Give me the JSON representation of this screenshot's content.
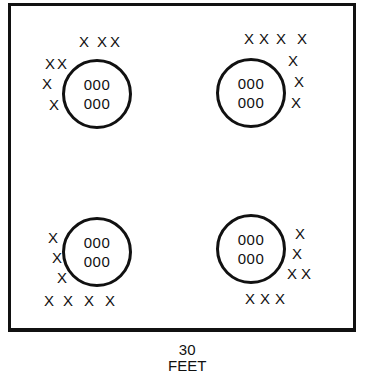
{
  "diagram": {
    "type": "plot-layout",
    "plots": [
      {
        "id": "top-left",
        "inner_lines": [
          "000",
          "000"
        ],
        "x_marks": [
          {
            "x": 79,
            "y": 34
          },
          {
            "x": 97,
            "y": 34
          },
          {
            "x": 110,
            "y": 34
          },
          {
            "x": 45,
            "y": 56
          },
          {
            "x": 57,
            "y": 56
          },
          {
            "x": 42,
            "y": 76
          },
          {
            "x": 49,
            "y": 97
          }
        ]
      },
      {
        "id": "top-right",
        "inner_lines": [
          "000",
          "000"
        ],
        "x_marks": [
          {
            "x": 244,
            "y": 31
          },
          {
            "x": 259,
            "y": 31
          },
          {
            "x": 276,
            "y": 31
          },
          {
            "x": 297,
            "y": 31
          },
          {
            "x": 288,
            "y": 53
          },
          {
            "x": 294,
            "y": 74
          },
          {
            "x": 291,
            "y": 95
          }
        ]
      },
      {
        "id": "bottom-left",
        "inner_lines": [
          "000",
          "000"
        ],
        "x_marks": [
          {
            "x": 48,
            "y": 230
          },
          {
            "x": 52,
            "y": 250
          },
          {
            "x": 57,
            "y": 270
          },
          {
            "x": 44,
            "y": 293
          },
          {
            "x": 63,
            "y": 293
          },
          {
            "x": 84,
            "y": 293
          },
          {
            "x": 105,
            "y": 293
          }
        ]
      },
      {
        "id": "bottom-right",
        "inner_lines": [
          "000",
          "000"
        ],
        "x_marks": [
          {
            "x": 295,
            "y": 226
          },
          {
            "x": 292,
            "y": 246
          },
          {
            "x": 287,
            "y": 266
          },
          {
            "x": 301,
            "y": 266
          },
          {
            "x": 245,
            "y": 291
          },
          {
            "x": 260,
            "y": 291
          },
          {
            "x": 275,
            "y": 291
          }
        ]
      }
    ],
    "x_glyph": "X",
    "scale": {
      "value": "30",
      "unit": "FEET"
    }
  }
}
